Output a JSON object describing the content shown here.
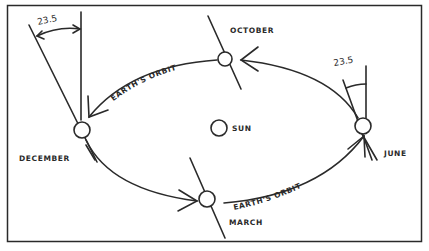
{
  "diagram": {
    "colors": {
      "ink": "#2a2a2a",
      "background": "#ffffff"
    },
    "sun": {
      "label": "SUN"
    },
    "positions": {
      "october": {
        "label": "OCTOBER"
      },
      "december": {
        "label": "DECEMBER"
      },
      "march": {
        "label": "MARCH"
      },
      "june": {
        "label": "JUNE"
      }
    },
    "orbit_labels": {
      "top": "EARTH'S ORBIT",
      "bottom": "EARTH'S ORBIT"
    },
    "tilt_angles": {
      "left": "23.5",
      "right": "23.5"
    }
  }
}
